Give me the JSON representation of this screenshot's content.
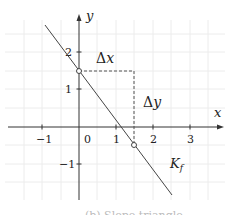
{
  "diagram": {
    "axes": {
      "x_label": "x",
      "y_label": "y",
      "x_ticks": [
        {
          "value": -1,
          "label": "−1"
        },
        {
          "value": 0,
          "label": "0"
        },
        {
          "value": 1,
          "label": "1"
        },
        {
          "value": 2,
          "label": "2"
        },
        {
          "value": 3,
          "label": "3"
        }
      ],
      "y_ticks": [
        {
          "value": 2,
          "label": "2"
        },
        {
          "value": 1,
          "label": "1"
        },
        {
          "value": -1,
          "label": "−1"
        }
      ],
      "x_range": [
        -2,
        4
      ],
      "y_range": [
        -2,
        3
      ],
      "grid_step": 0.5
    },
    "line": {
      "name": "K_f",
      "label_main": "K",
      "label_sub": "f",
      "slope": -1.333,
      "intercept": 1.5,
      "color": "#444444"
    },
    "points": [
      {
        "x": 0,
        "y": 1.5,
        "style": "open-circle"
      },
      {
        "x": 1.5,
        "y": -0.5,
        "style": "open-circle"
      }
    ],
    "slope_triangle": {
      "delta_x_label": "Δx",
      "delta_x_symbol": "Δ",
      "delta_x_var": "x",
      "delta_y_label": "Δy",
      "delta_y_symbol": "Δ",
      "delta_y_var": "y",
      "style": "dashed"
    },
    "caption": "(b) Slope triangle"
  }
}
